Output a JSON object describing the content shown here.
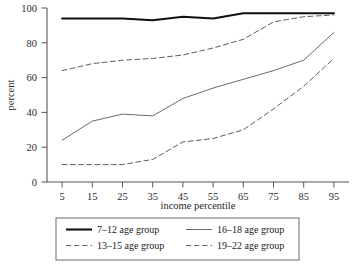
{
  "chart_data": {
    "type": "line",
    "title": "",
    "xlabel": "income percentile",
    "ylabel": "percent",
    "x": [
      5,
      15,
      25,
      35,
      45,
      55,
      65,
      75,
      85,
      95
    ],
    "xtick_labels": [
      "5",
      "15",
      "25",
      "35",
      "45",
      "55",
      "65",
      "75",
      "85",
      "95"
    ],
    "ytick_labels": [
      "0",
      "20",
      "40",
      "60",
      "80",
      "100"
    ],
    "yticks": [
      0,
      20,
      40,
      60,
      80,
      100
    ],
    "xlim": [
      0,
      100
    ],
    "ylim": [
      0,
      100
    ],
    "grid": false,
    "legend_position": "below-axes",
    "series": [
      {
        "name": "7–12 age group",
        "style": "solid-thick",
        "color": "#111111",
        "values": [
          94,
          94,
          94,
          93,
          95,
          94,
          97,
          97,
          97,
          97
        ]
      },
      {
        "name": "13–15 age group",
        "style": "dashed",
        "color": "#4a4a4a",
        "values": [
          64,
          68,
          70,
          71,
          73,
          77,
          82,
          92,
          95,
          96
        ]
      },
      {
        "name": "16–18 age group",
        "style": "solid-thin",
        "color": "#5a5a5a",
        "values": [
          24,
          35,
          39,
          38,
          48,
          54,
          59,
          64,
          70,
          86
        ]
      },
      {
        "name": "19–22 age group",
        "style": "dashed",
        "color": "#4a4a4a",
        "values": [
          10,
          10,
          10,
          13,
          23,
          25,
          30,
          42,
          55,
          71
        ]
      }
    ]
  },
  "axes": {
    "ylabel": "percent",
    "xlabel": "income percentile"
  },
  "legend": {
    "entries": [
      {
        "label": "7–12 age group",
        "style": "solid-thick"
      },
      {
        "label": "16–18 age group",
        "style": "solid-thin"
      },
      {
        "label": "13–15 age group",
        "style": "dashed"
      },
      {
        "label": "19–22 age group",
        "style": "dashed"
      }
    ]
  }
}
